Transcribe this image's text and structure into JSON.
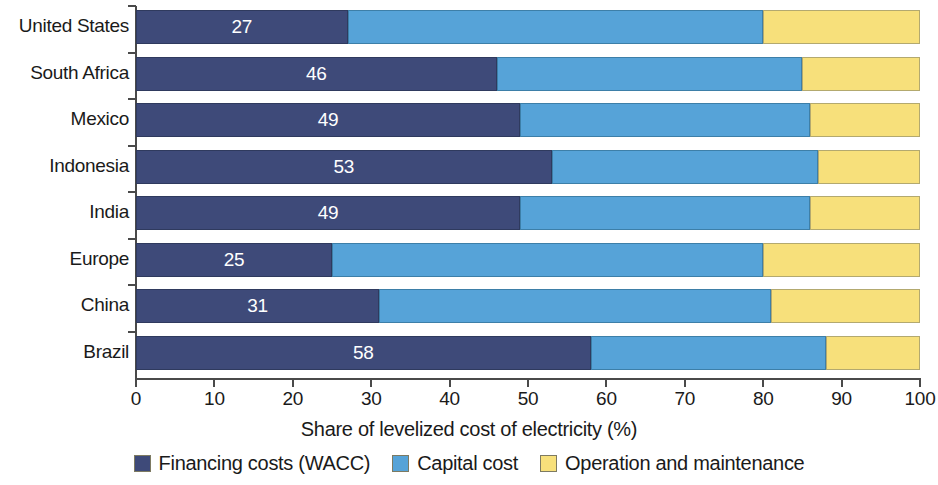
{
  "chart_data": {
    "type": "bar",
    "orientation": "horizontal",
    "stacked": true,
    "normalized": true,
    "title": "",
    "xlabel": "Share of levelized cost of electricity (%)",
    "ylabel": "",
    "xlim": [
      0,
      100
    ],
    "xticks": [
      0,
      10,
      20,
      30,
      40,
      50,
      60,
      70,
      80,
      90,
      100
    ],
    "xtick_labels": [
      "0",
      "10",
      "20",
      "30",
      "40",
      "50",
      "60",
      "70",
      "80",
      "90",
      "100"
    ],
    "grid": false,
    "legend_position": "bottom",
    "categories": [
      "United States",
      "South Africa",
      "Mexico",
      "Indonesia",
      "India",
      "Europe",
      "China",
      "Brazil"
    ],
    "series": [
      {
        "name": "Financing costs (WACC)",
        "color": "#3e4a79",
        "values": [
          27,
          46,
          49,
          53,
          49,
          25,
          31,
          58
        ],
        "data_labels": [
          "27",
          "46",
          "49",
          "53",
          "49",
          "25",
          "31",
          "58"
        ]
      },
      {
        "name": "Capital cost",
        "color": "#56a3d8",
        "values": [
          53,
          39,
          37,
          34,
          37,
          55,
          50,
          30
        ],
        "data_labels": [
          "",
          "",
          "",
          "",
          "",
          "",
          "",
          ""
        ]
      },
      {
        "name": "Operation and maintenance",
        "color": "#f7e07b",
        "values": [
          20,
          15,
          14,
          13,
          14,
          20,
          19,
          12
        ],
        "data_labels": [
          "",
          "",
          "",
          "",
          "",
          "",
          "",
          ""
        ]
      }
    ],
    "cumulative_boundaries": [
      [
        27,
        80
      ],
      [
        46,
        85
      ],
      [
        49,
        86
      ],
      [
        53,
        87
      ],
      [
        49,
        86
      ],
      [
        25,
        80
      ],
      [
        31,
        81
      ],
      [
        58,
        88
      ]
    ]
  },
  "legend": {
    "items": [
      {
        "label": "Financing costs (WACC)",
        "color": "#3e4a79"
      },
      {
        "label": "Capital cost",
        "color": "#56a3d8"
      },
      {
        "label": "Operation and maintenance",
        "color": "#f7e07b"
      }
    ]
  },
  "colors": {
    "financing": "#3e4a79",
    "capital": "#56a3d8",
    "om": "#f7e07b",
    "axis": "#4a4a4a",
    "text": "#1a1a1a",
    "value_text": "#ffffff",
    "background": "#ffffff"
  }
}
